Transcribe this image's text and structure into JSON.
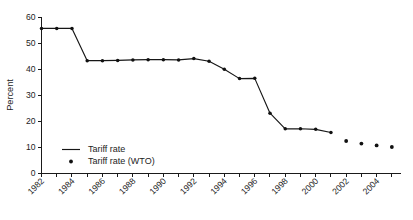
{
  "chart_data": {
    "type": "line",
    "title": "",
    "subtitle": "",
    "xlabel": "",
    "ylabel": "Percent",
    "xlim": [
      1982,
      2005.6
    ],
    "ylim": [
      0,
      60
    ],
    "grid": false,
    "legend_position": "center-left",
    "y_ticks": [
      0,
      10,
      20,
      30,
      40,
      50,
      60
    ],
    "y_tick_labels": [
      "0",
      "10",
      "20",
      "30",
      "40",
      "50",
      "60"
    ],
    "x_ticks": [
      1982,
      1983,
      1984,
      1985,
      1986,
      1987,
      1988,
      1989,
      1990,
      1991,
      1992,
      1993,
      1994,
      1995,
      1996,
      1997,
      1998,
      1999,
      2000,
      2001,
      2002,
      2003,
      2004,
      2005
    ],
    "x_tick_labels_major": [
      "1982",
      "1984",
      "1986",
      "1988",
      "1990",
      "1992",
      "1994",
      "1996",
      "1998",
      "2000",
      "2002",
      "2004"
    ],
    "x_major_values": [
      1982,
      1984,
      1986,
      1988,
      1990,
      1992,
      1994,
      1996,
      1998,
      2000,
      2002,
      2004
    ],
    "series": [
      {
        "name": "Tariff rate",
        "style": "line-with-markers",
        "color": "#161616",
        "x": [
          1982,
          1983,
          1984,
          1985,
          1986,
          1987,
          1988,
          1989,
          1990,
          1991,
          1992,
          1993,
          1994,
          1995,
          1996,
          1997,
          1998,
          1999,
          2000,
          2001
        ],
        "values": [
          55.6,
          55.6,
          55.6,
          43.2,
          43.2,
          43.3,
          43.5,
          43.6,
          43.6,
          43.5,
          44.0,
          43.0,
          39.9,
          36.3,
          36.4,
          23.0,
          17.0,
          17.0,
          16.8,
          15.6
        ]
      },
      {
        "name": "Tariff rate (WTO)",
        "style": "markers-only",
        "color": "#111111",
        "x": [
          2002,
          2003,
          2004,
          2005
        ],
        "values": [
          12.3,
          11.3,
          10.6,
          10.0
        ]
      }
    ],
    "legend": [
      {
        "label": "Tariff rate",
        "marker": "line"
      },
      {
        "label": "Tariff rate (WTO)",
        "marker": "dot"
      }
    ]
  }
}
